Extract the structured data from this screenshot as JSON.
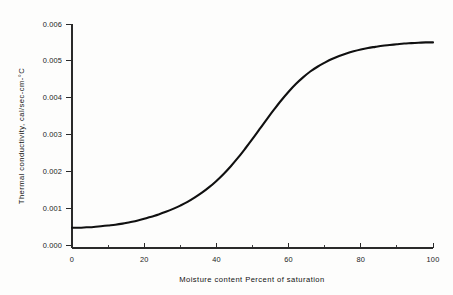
{
  "chart_data": {
    "type": "line",
    "title": "",
    "subtitle": "",
    "xlabel": "Moisture content   Percent of saturation",
    "ylabel": "Thermal conductivity, cal/sec-cm-°C",
    "xlim": [
      0,
      100
    ],
    "ylim": [
      0.0,
      0.006
    ],
    "grid": false,
    "legend": false,
    "legend_position": "none",
    "x_ticks_major": [
      0,
      20,
      40,
      60,
      80,
      100
    ],
    "x_tick_labels": [
      "0",
      "20",
      "40",
      "60",
      "80",
      "100"
    ],
    "x_ticks_minor": [
      10,
      30,
      50,
      70,
      90
    ],
    "y_ticks_major": [
      0.0,
      0.001,
      0.002,
      0.003,
      0.004,
      0.005,
      0.006
    ],
    "y_tick_labels": [
      "0.000",
      "0.001",
      "0.002",
      "0.003",
      "0.004",
      "0.005",
      "0.006"
    ],
    "series": [
      {
        "name": "Thermal conductivity vs moisture content",
        "color": "#101010",
        "x": [
          0,
          2,
          4,
          6,
          8,
          10,
          12,
          14,
          16,
          18,
          20,
          22,
          24,
          26,
          28,
          30,
          32,
          34,
          36,
          38,
          40,
          42,
          44,
          46,
          48,
          50,
          52,
          54,
          56,
          58,
          60,
          62,
          64,
          66,
          68,
          70,
          72,
          74,
          76,
          78,
          80,
          82,
          84,
          86,
          88,
          90,
          92,
          94,
          96,
          98,
          100
        ],
        "y": [
          0.00047,
          0.00047,
          0.00048,
          0.00049,
          0.00051,
          0.00053,
          0.00055,
          0.00058,
          0.00062,
          0.00066,
          0.00071,
          0.00077,
          0.00083,
          0.0009,
          0.00098,
          0.00107,
          0.00117,
          0.00129,
          0.00142,
          0.00157,
          0.00174,
          0.00193,
          0.00214,
          0.00237,
          0.00262,
          0.00288,
          0.00315,
          0.00342,
          0.00368,
          0.00393,
          0.00416,
          0.00437,
          0.00455,
          0.00471,
          0.00484,
          0.00495,
          0.00505,
          0.00513,
          0.0052,
          0.00526,
          0.00531,
          0.00535,
          0.00538,
          0.00541,
          0.00543,
          0.00545,
          0.00547,
          0.00548,
          0.00549,
          0.0055,
          0.0055
        ]
      }
    ],
    "notes": {
      "start_value": "0.00047",
      "plateau_value": "0.00550",
      "inflection_x": "57",
      "shape": "sigmoid / S-curve"
    }
  },
  "axes": {
    "x_title": "Moisture content   Percent of saturation",
    "y_title": "Thermal conductivity, cal/sec-cm-°C",
    "x_labels": [
      "0",
      "20",
      "40",
      "60",
      "80",
      "100"
    ],
    "y_labels": [
      "0.000",
      "0.001",
      "0.002",
      "0.003",
      "0.004",
      "0.005",
      "0.006"
    ]
  },
  "style": {
    "background": "#fdfdfc",
    "curve_color": "#101010",
    "axis_color": "#2a2a2a",
    "text_color": "#1b1b1b"
  }
}
